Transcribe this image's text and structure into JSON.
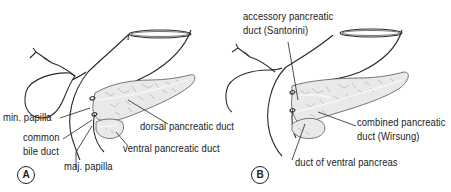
{
  "figure": {
    "panels": [
      {
        "id": "A",
        "badge": "A",
        "labels": {
          "min_papilla": "min. papilla",
          "common_bile_duct_line1": "common",
          "common_bile_duct_line2": "bile duct",
          "maj_papilla": "maj. papilla",
          "dorsal_duct": "dorsal pancreatic duct",
          "ventral_duct": "ventral pancreatic duct"
        }
      },
      {
        "id": "B",
        "badge": "B",
        "labels": {
          "accessory_line1": "accessory pancreatic",
          "accessory_line2": "duct (Santorini)",
          "combined_line1": "combined pancreatic",
          "combined_line2": "duct (Wirsung)",
          "ventral_pancreas_duct": "duct of ventral pancreas"
        }
      }
    ],
    "colors": {
      "line": "#2a2a2a",
      "gland_fill": "#e9e9e9",
      "background": "#ffffff"
    }
  }
}
